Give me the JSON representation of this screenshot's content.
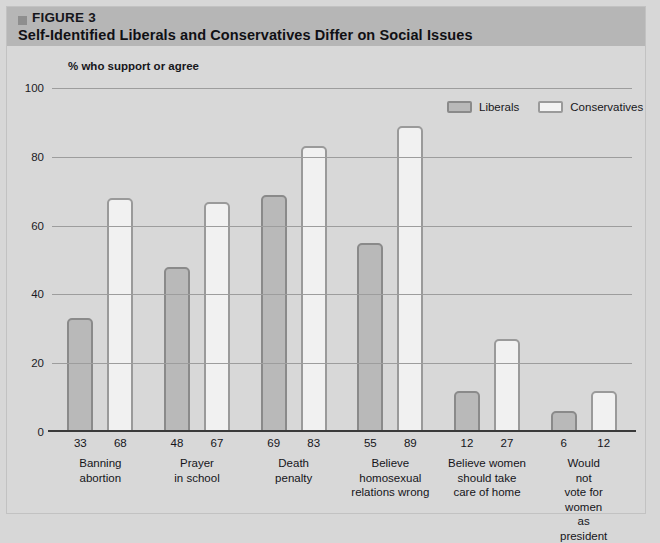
{
  "header": {
    "bullet_icon": "square-bullet-icon",
    "figure_label": "FIGURE 3",
    "title": "Self-Identified Liberals and Conservatives Differ on Social Issues"
  },
  "colors": {
    "header_band": "#b6b6b6",
    "page_background": "#d7d7d7",
    "liberals_fill": "#b9b9b9",
    "conservatives_fill": "#f1f1f1",
    "bar_stroke": "#8d8d8d",
    "gridline": "#9d9d9d",
    "axis": "#3a3a3a"
  },
  "legend": {
    "position": "top-right",
    "items": [
      {
        "label": "Liberals",
        "swatch": "liberals-swatch"
      },
      {
        "label": "Conservatives",
        "swatch": "conservatives-swatch"
      }
    ]
  },
  "chart_data": {
    "type": "bar",
    "title": "Self-Identified Liberals and Conservatives Differ on Social Issues",
    "subtitle": "% who support or agree",
    "xlabel": "",
    "ylabel": "",
    "ylim": [
      0,
      100
    ],
    "yticks": [
      0,
      20,
      40,
      60,
      80,
      100
    ],
    "ytick_labels": [
      "0",
      "20",
      "40",
      "60",
      "80",
      "100"
    ],
    "grid": true,
    "legend_position": "top-right",
    "categories": [
      "Banning\nabortion",
      "Prayer\nin school",
      "Death\npenalty",
      "Believe\nhomosexual\nrelations wrong",
      "Believe women\nshould take\ncare of home",
      "Would not\nvote for\nwomen as\npresident"
    ],
    "series": [
      {
        "name": "Liberals",
        "values": [
          33,
          48,
          69,
          55,
          12,
          6
        ]
      },
      {
        "name": "Conservatives",
        "values": [
          68,
          67,
          83,
          89,
          27,
          12
        ]
      }
    ]
  }
}
